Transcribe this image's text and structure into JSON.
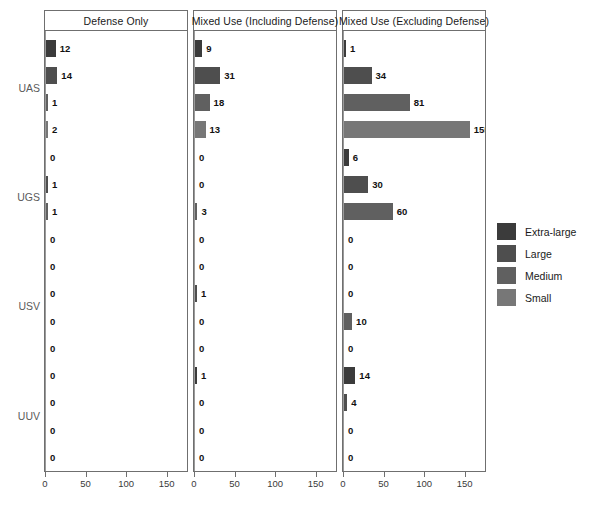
{
  "chart_data": {
    "type": "bar",
    "orientation": "horizontal",
    "title": "",
    "xlabel": "",
    "ylabel": "",
    "xlim": [
      0,
      175
    ],
    "xticks": [
      0,
      50,
      100,
      150
    ],
    "grid": false,
    "legend_position": "right",
    "facet_label": "panel",
    "group_label": "platform",
    "series_label": "size class",
    "categories": [
      "UAS",
      "UGS",
      "USV",
      "UUV"
    ],
    "series": [
      {
        "name": "Extra-large",
        "color": "#3b3b3b"
      },
      {
        "name": "Large",
        "color": "#4e4e4e"
      },
      {
        "name": "Medium",
        "color": "#606060"
      },
      {
        "name": "Small",
        "color": "#777777"
      }
    ],
    "panels": [
      {
        "label": "Defense Only",
        "groups": [
          {
            "name": "UAS",
            "values": [
              12,
              14,
              1,
              2,
              0
            ]
          },
          {
            "name": "UGS",
            "values": [
              0,
              1,
              1,
              0,
              3
            ]
          },
          {
            "name": "USV",
            "values": [
              0,
              0,
              0,
              0,
              0
            ]
          },
          {
            "name": "UUV",
            "values": [
              0,
              0,
              0,
              0,
              0
            ]
          }
        ]
      },
      {
        "label": "Mixed Use (Including Defense)",
        "groups": [
          {
            "name": "UAS",
            "values": [
              9,
              31,
              18,
              13,
              0
            ]
          },
          {
            "name": "UGS",
            "values": [
              0,
              0,
              3,
              0,
              0
            ]
          },
          {
            "name": "USV",
            "values": [
              0,
              1,
              0,
              0,
              1
            ]
          },
          {
            "name": "UUV",
            "values": [
              1,
              0,
              0,
              0,
              0
            ]
          }
        ]
      },
      {
        "label": "Mixed Use (Excluding Defense)",
        "groups": [
          {
            "name": "UAS",
            "values": [
              1,
              34,
              81,
              155,
              0
            ]
          },
          {
            "name": "UGS",
            "values": [
              6,
              30,
              60,
              0,
              0
            ]
          },
          {
            "name": "USV",
            "values": [
              0,
              0,
              10,
              0,
              6
            ]
          },
          {
            "name": "UUV",
            "values": [
              14,
              4,
              0,
              0,
              0
            ]
          }
        ]
      }
    ],
    "rows": [
      {
        "panel": 0,
        "label": "12",
        "value": 12,
        "series": 0,
        "group": "UAS"
      },
      {
        "panel": 0,
        "label": "14",
        "value": 14,
        "series": 1,
        "group": "UAS"
      },
      {
        "panel": 0,
        "label": "1",
        "value": 1,
        "series": 2,
        "group": "UAS"
      },
      {
        "panel": 0,
        "label": "2",
        "value": 2,
        "series": 3,
        "group": "UAS"
      },
      {
        "panel": 0,
        "label": "0",
        "value": 0,
        "series": 0,
        "group": "UGS"
      },
      {
        "panel": 0,
        "label": "0",
        "value": 0,
        "series": 1,
        "group": "UGS"
      },
      {
        "panel": 0,
        "label": "1",
        "value": 1,
        "series": 2,
        "group": "UGS"
      },
      {
        "panel": 0,
        "label": "1",
        "value": 1,
        "series": 3,
        "group": "UGS"
      },
      {
        "panel": 0,
        "label": "0",
        "value": 0,
        "series": 0,
        "group": "USV"
      },
      {
        "panel": 0,
        "label": "3",
        "value": 3,
        "series": 1,
        "group": "USV"
      },
      {
        "panel": 0,
        "label": "0",
        "value": 0,
        "series": 2,
        "group": "USV"
      },
      {
        "panel": 0,
        "label": "0",
        "value": 0,
        "series": 3,
        "group": "USV"
      },
      {
        "panel": 0,
        "label": "0",
        "value": 0,
        "series": 0,
        "group": "UUV"
      },
      {
        "panel": 0,
        "label": "0",
        "value": 0,
        "series": 1,
        "group": "UUV"
      },
      {
        "panel": 0,
        "label": "0",
        "value": 0,
        "series": 2,
        "group": "UUV"
      },
      {
        "panel": 0,
        "label": "0",
        "value": 0,
        "series": 3,
        "group": "UUV"
      },
      {
        "panel": 1,
        "label": "9",
        "value": 9,
        "series": 0,
        "group": "UAS"
      },
      {
        "panel": 1,
        "label": "31",
        "value": 31,
        "series": 1,
        "group": "UAS"
      },
      {
        "panel": 1,
        "label": "18",
        "value": 18,
        "series": 2,
        "group": "UAS"
      },
      {
        "panel": 1,
        "label": "13",
        "value": 13,
        "series": 3,
        "group": "UAS"
      },
      {
        "panel": 1,
        "label": "0",
        "value": 0,
        "series": 0,
        "group": "UGS"
      },
      {
        "panel": 1,
        "label": "0",
        "value": 0,
        "series": 1,
        "group": "UGS"
      },
      {
        "panel": 1,
        "label": "0",
        "value": 0,
        "series": 2,
        "group": "UGS"
      },
      {
        "panel": 1,
        "label": "3",
        "value": 3,
        "series": 3,
        "group": "UGS"
      },
      {
        "panel": 1,
        "label": "0",
        "value": 0,
        "series": 0,
        "group": "USV"
      },
      {
        "panel": 1,
        "label": "0",
        "value": 0,
        "series": 1,
        "group": "USV"
      },
      {
        "panel": 1,
        "label": "1",
        "value": 1,
        "series": 2,
        "group": "USV"
      },
      {
        "panel": 1,
        "label": "0",
        "value": 0,
        "series": 3,
        "group": "USV"
      },
      {
        "panel": 1,
        "label": "0",
        "value": 0,
        "series": 0,
        "group": "UUV"
      },
      {
        "panel": 1,
        "label": "1",
        "value": 1,
        "series": 1,
        "group": "UUV"
      },
      {
        "panel": 1,
        "label": "1",
        "value": 1,
        "series": 2,
        "group": "UUV"
      },
      {
        "panel": 1,
        "label": "0",
        "value": 0,
        "series": 3,
        "group": "UUV"
      },
      {
        "panel": 2,
        "label": "1",
        "value": 1,
        "series": 0,
        "group": "UAS"
      },
      {
        "panel": 2,
        "label": "34",
        "value": 34,
        "series": 1,
        "group": "UAS"
      },
      {
        "panel": 2,
        "label": "81",
        "value": 81,
        "series": 2,
        "group": "UAS"
      },
      {
        "panel": 2,
        "label": "155",
        "value": 155,
        "series": 3,
        "group": "UAS"
      },
      {
        "panel": 2,
        "label": "0",
        "value": 0,
        "series": 0,
        "group": "UGS"
      },
      {
        "panel": 2,
        "label": "6",
        "value": 6,
        "series": 1,
        "group": "UGS"
      },
      {
        "panel": 2,
        "label": "30",
        "value": 30,
        "series": 2,
        "group": "UGS"
      },
      {
        "panel": 2,
        "label": "60",
        "value": 60,
        "series": 3,
        "group": "UGS"
      },
      {
        "panel": 2,
        "label": "0",
        "value": 0,
        "series": 0,
        "group": "USV"
      },
      {
        "panel": 2,
        "label": "0",
        "value": 0,
        "series": 1,
        "group": "USV"
      },
      {
        "panel": 2,
        "label": "0",
        "value": 0,
        "series": 2,
        "group": "USV"
      },
      {
        "panel": 2,
        "label": "10",
        "value": 10,
        "series": 3,
        "group": "USV"
      },
      {
        "panel": 2,
        "label": "0",
        "value": 0,
        "series": 0,
        "group": "UUV"
      },
      {
        "panel": 2,
        "label": "6",
        "value": 6,
        "series": 1,
        "group": "UUV"
      },
      {
        "panel": 2,
        "label": "14",
        "value": 14,
        "series": 2,
        "group": "UUV"
      },
      {
        "panel": 2,
        "label": "4",
        "value": 4,
        "series": 3,
        "group": "UUV"
      }
    ]
  },
  "legend": {
    "items": [
      {
        "label": "Extra-large",
        "color": "#3b3b3b"
      },
      {
        "label": "Large",
        "color": "#4e4e4e"
      },
      {
        "label": "Medium",
        "color": "#606060"
      },
      {
        "label": "Small",
        "color": "#777777"
      }
    ]
  },
  "axis": {
    "group_labels": [
      "UAS",
      "UGS",
      "USV",
      "UUV"
    ],
    "xticks": [
      "0",
      "50",
      "100",
      "150"
    ]
  }
}
